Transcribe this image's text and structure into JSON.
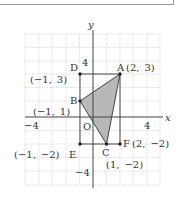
{
  "figure": {
    "axes": {
      "x_label": "x",
      "y_label": "y",
      "origin_label": "O"
    },
    "ticks": {
      "x_neg": "−4",
      "x_pos": "4",
      "y_pos": "4",
      "y_neg": "−4"
    },
    "points": {
      "A": {
        "name": "A",
        "coords": "(2, 3)"
      },
      "B": {
        "name": "B",
        "coords": "(−1, 1)"
      },
      "C": {
        "name": "C",
        "coords": "(1, −2)"
      },
      "D": {
        "name": "D",
        "coords": "(−1, 3)"
      },
      "E": {
        "name": "E",
        "coords": "(−1, −2)"
      },
      "F": {
        "name": "F",
        "coords": "(2, −2)"
      }
    },
    "colors": {
      "shade": "#b8b8b8",
      "grid": "#c8c8c8",
      "line": "#333333"
    }
  }
}
